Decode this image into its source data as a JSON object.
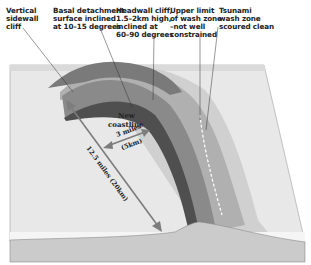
{
  "diagram": {
    "type": "block diagram",
    "labels": {
      "sidewall": "Vertical\nsidewall\ncliff",
      "basal": "Basal detachment\nsurface inclined\nat 10–15 degrees",
      "headwall": "Headwall cliff,\n1.5–2km high,\ninclined at\n60–90 degrees",
      "upper_limit": "Upper limit\nof wash zone\n–not well\nconstrained",
      "tsunami_zone": "Tsunami\nwash zone\nscoured clean",
      "new_coastline_1": "New",
      "new_coastline_2": "coastline",
      "width_miles": "3 miles",
      "width_km": "(5km)",
      "length": "12.5 miles (20km)"
    },
    "colors": {
      "sea_surface": "#e6e6e6",
      "block_side": "#cfcfcf",
      "headwall_dark": "#5a5a5a",
      "scar_mid": "#8e8e8e",
      "wash_zone": "#b4b4b4",
      "outer_zone": "#c8c8c8",
      "arrow": "#7d7d7d",
      "leader_line": "#333333"
    }
  }
}
